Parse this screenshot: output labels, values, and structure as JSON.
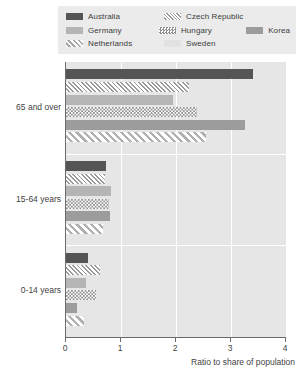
{
  "legend": {
    "rows": [
      [
        {
          "name": "Australia",
          "pattern": "solid-dark",
          "swatch_class": "f-australia"
        },
        {
          "name": "Czech Republic",
          "pattern": "diagonal-hatch-fine",
          "swatch_class": "f-czech"
        }
      ],
      [
        {
          "name": "Germany",
          "pattern": "solid-gray",
          "swatch_class": "f-germany"
        },
        {
          "name": "Hungary",
          "pattern": "checkerboard",
          "swatch_class": "f-hungary"
        },
        {
          "name": "Korea",
          "pattern": "solid-mid-gray",
          "swatch_class": "f-korea"
        }
      ],
      [
        {
          "name": "Netherlands",
          "pattern": "diagonal-hatch-wide",
          "swatch_class": "f-netherlands"
        },
        {
          "name": "Sweden",
          "pattern": "solid-light",
          "swatch_class": "f-sweden"
        }
      ]
    ]
  },
  "chart_data": {
    "type": "bar",
    "orientation": "horizontal",
    "title": "",
    "xlabel": "Ratio to share of population",
    "ylabel": "",
    "xlim": [
      0,
      4
    ],
    "xticks": [
      0,
      1,
      2,
      3,
      4
    ],
    "xtick_labels": [
      "0",
      "1",
      "2",
      "3",
      "4"
    ],
    "grid": "vertical-white",
    "legend_position": "top",
    "categories": [
      "65 and over",
      "15-64 years",
      "0-14 years"
    ],
    "series": [
      {
        "name": "Australia",
        "values": [
          3.4,
          0.72,
          0.4
        ]
      },
      {
        "name": "Czech Republic",
        "values": [
          2.23,
          0.7,
          0.62
        ]
      },
      {
        "name": "Germany",
        "values": [
          1.95,
          0.82,
          0.36
        ]
      },
      {
        "name": "Hungary",
        "values": [
          2.38,
          0.78,
          0.55
        ]
      },
      {
        "name": "Korea",
        "values": [
          3.25,
          0.8,
          0.2
        ]
      },
      {
        "name": "Netherlands",
        "values": [
          2.55,
          0.68,
          0.32
        ]
      }
    ],
    "colors": {
      "Australia": "#555555",
      "Germany": "#b5b5b5",
      "Korea": "#9c9c9c",
      "Sweden": "#dcdcdc",
      "plot_background": "#e6e6e6",
      "gridline": "#ffffff",
      "axis": "#6b6b6b",
      "text": "#3f3f3f"
    }
  }
}
